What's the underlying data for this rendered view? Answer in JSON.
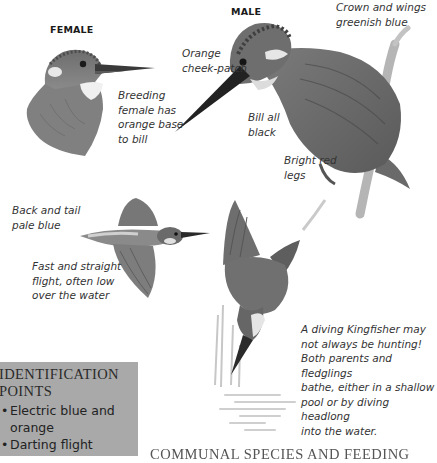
{
  "page": {
    "subject": "Kingfisher",
    "labels": {
      "female": "FEMALE",
      "male": "MALE"
    },
    "captions": {
      "female_bill": "Breeding\nfemale has\norange base\nto bill",
      "orange_cheek": "Orange\ncheek-patch",
      "crown_wings": "Crown and wings\ngreenish blue",
      "bill_black": "Bill all\nblack",
      "red_legs": "Bright red\nlegs",
      "back_tail": "Back and tail\npale blue",
      "flight": "Fast and straight\nflight, often low\nover the water",
      "diving": "A diving Kingfisher may\nnot always be hunting!\nBoth parents and fledglings\nbathe, either in a shallow\npool or by diving headlong\ninto the water."
    },
    "illustrations": [
      {
        "name": "female-head",
        "description": "Female kingfisher head and breast"
      },
      {
        "name": "male-perched",
        "description": "Male kingfisher perched on branch"
      },
      {
        "name": "bird-in-flight",
        "description": "Kingfisher in flight"
      },
      {
        "name": "bird-diving",
        "description": "Kingfisher diving into water"
      }
    ],
    "identification": {
      "title": "IDENTIFICATION\nPOINTS",
      "bullet_glyph": "•",
      "points": [
        "Electric blue and",
        "orange",
        "Darting flight"
      ]
    },
    "bottom_heading": "COMMUNAL SPECIES AND FEEDING"
  },
  "colors": {
    "background": "#ffffff",
    "id_box": "#a9a9a9",
    "text": "#333333"
  }
}
